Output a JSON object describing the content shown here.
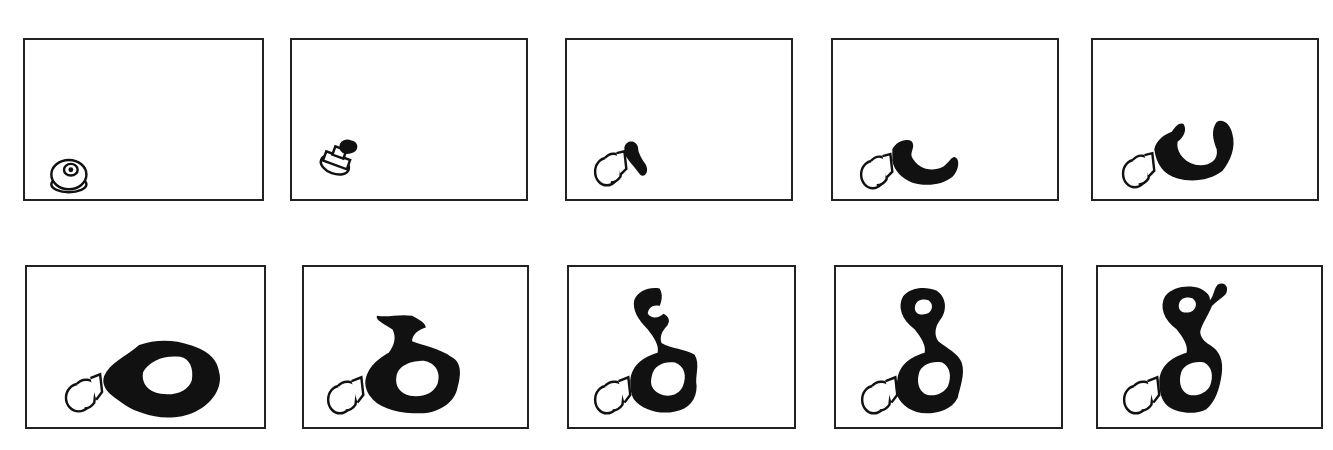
{
  "figure": {
    "rows": 2,
    "columns": 5,
    "ink_color": "#111111",
    "border_color": "#222222",
    "background": "#ffffff",
    "panels": [
      {
        "index": 1,
        "stage": "nozzle-only"
      },
      {
        "index": 2,
        "stage": "first-spray-blob"
      },
      {
        "index": 3,
        "stage": "short-stroke"
      },
      {
        "index": 4,
        "stage": "hook-curve"
      },
      {
        "index": 5,
        "stage": "u-curve"
      },
      {
        "index": 6,
        "stage": "closed-loop"
      },
      {
        "index": 7,
        "stage": "loop-with-stem-start"
      },
      {
        "index": 8,
        "stage": "stem-and-partial-upper-loop"
      },
      {
        "index": 9,
        "stage": "upper-loop-closed"
      },
      {
        "index": 10,
        "stage": "upper-loop-with-tail"
      }
    ]
  }
}
